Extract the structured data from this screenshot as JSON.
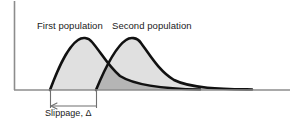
{
  "figure": {
    "labels": {
      "first_population": "First population",
      "second_population": "Second population",
      "slippage": "Slippage, Δ"
    },
    "colors": {
      "curve_stroke": "#111111",
      "axis": "#8c8c8c",
      "baseline": "#8c8c8c",
      "fill_single": "#e0e0e0",
      "fill_overlap": "#b5b5b5",
      "annotation": "#6f6f6f",
      "text": "#1a1a1a",
      "background": "#ffffff"
    }
  },
  "chart_data": {
    "type": "area",
    "title": "",
    "xlabel": "",
    "ylabel": "",
    "grid": false,
    "legend_position": "inline-above-curves",
    "axes": {
      "y_axis_x": 14,
      "y_axis_top": 1,
      "baseline_y": 90,
      "baseline_x_start": 14,
      "baseline_x_end": 290
    },
    "series": [
      {
        "name": "First population",
        "label_x": 37,
        "label_y": 20,
        "fill": "#e0e0e0",
        "stroke": "#111111",
        "start_x": 50,
        "peak_x": 85,
        "peak_y": 38,
        "end_x": 200,
        "path": "M50,90 C56,74 66,48 78,40 C82,37 88,37 92,42 C100,51 108,66 120,76 C136,86 168,89 200,89.5 L200,90 Z"
      },
      {
        "name": "Second population",
        "label_x": 112,
        "label_y": 20,
        "fill": "#e0e0e0",
        "stroke": "#111111",
        "start_x": 96,
        "peak_x": 133,
        "peak_y": 39,
        "end_x": 252,
        "path": "M96,90 C103,73 114,48 126,40 C130,37 137,37 141,43 C150,55 159,71 174,80 C192,89 226,89 252,89.5 L252,90 Z"
      }
    ],
    "overlap": {
      "fill": "#b5b5b5",
      "x_start": 96,
      "x_end": 200,
      "description": "Region where the two population curves overlap, shaded darker"
    },
    "annotation": {
      "name": "slippage",
      "label": "Slippage, Δ",
      "tick_left_x": 50,
      "tick_right_x": 96,
      "tick_top_y": 90,
      "tick_bottom_y": 108,
      "arrow_y": 106,
      "arrow_direction": "left",
      "measures": "Horizontal shift between the two population distributions"
    }
  }
}
